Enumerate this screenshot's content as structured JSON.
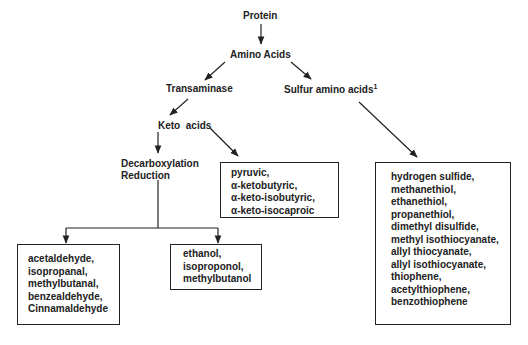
{
  "diagram": {
    "nodes": {
      "protein": "Protein",
      "amino_acids": "Amino Acids",
      "transaminase": "Transaminase",
      "sulfur_amino_acids": "Sulfur amino acids",
      "sulfur_footnote": "1",
      "keto_acids": "Keto  acids",
      "decarboxylation": "Decarboxylation",
      "reduction": "Reduction"
    },
    "boxes": {
      "keto_products": [
        "pyruvic,",
        "α-ketobutyric,",
        "α-keto-isobutyric,",
        "α-keto-isocaproic"
      ],
      "aldehydes": [
        "acetaldehyde,",
        "isopropanal,",
        "methylbutanal,",
        "benzealdehyde,",
        "Cinnamaldehyde"
      ],
      "alcohols": [
        "ethanol,",
        "isoproponol,",
        "methylbutanol"
      ],
      "sulfur_compounds": [
        "hydrogen sulfide,",
        "methanethiol,",
        "ethanethiol,",
        "propanethiol,",
        "dimethyl disulfide,",
        "methyl isothiocyanate,",
        "allyl thiocyanate,",
        "allyl isothiocyanate,",
        "thiophene,",
        "acetylthiophene,",
        "benzothiophene"
      ]
    }
  }
}
